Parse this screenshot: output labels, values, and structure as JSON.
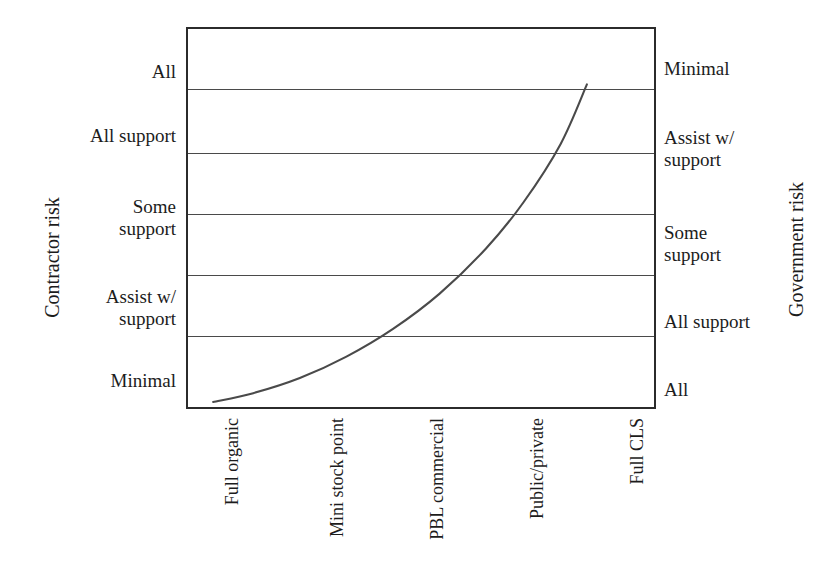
{
  "chart_data": {
    "type": "line",
    "title": "",
    "xlabel": "",
    "ylabel_left": "Contractor risk",
    "ylabel_right": "Government risk",
    "grid": true,
    "legend": "none",
    "categories": [
      "Full organic",
      "Mini stock point",
      "PBL commercial",
      "Public/private",
      "Full CLS"
    ],
    "y_left_ticks": [
      "Minimal",
      "Assist w/\nsupport",
      "Some\nsupport",
      "All support",
      "All"
    ],
    "y_right_ticks": [
      "All",
      "All support",
      "Some\nsupport",
      "Assist w/\nsupport",
      "Minimal"
    ],
    "ylim": [
      0,
      6
    ],
    "xlim": [
      0,
      5
    ],
    "series": [
      {
        "name": "Risk transfer curve",
        "color": "#4a4a4a",
        "x": [
          0.27,
          0.7,
          1.2,
          1.7,
          2.2,
          2.7,
          3.2,
          3.6,
          4.0,
          4.28
        ],
        "y": [
          0.08,
          0.22,
          0.46,
          0.8,
          1.24,
          1.8,
          2.52,
          3.25,
          4.18,
          5.12
        ]
      }
    ],
    "axis_ranges": {
      "y_min_label": "Minimal",
      "y_max_label": "All"
    }
  },
  "axes": {
    "left_title": "Contractor risk",
    "right_title": "Government risk"
  },
  "y_left": {
    "t0": "Minimal",
    "t1": "Assist w/\nsupport",
    "t2": "Some\nsupport",
    "t3": "All support",
    "t4": "All"
  },
  "y_right": {
    "t0": "All",
    "t1": "All support",
    "t2": "Some\nsupport",
    "t3": "Assist w/\nsupport",
    "t4": "Minimal"
  },
  "x_ticks": {
    "t0": "Full organic",
    "t1": "Mini stock point",
    "t2": "PBL commercial",
    "t3": "Public/private",
    "t4": "Full CLS"
  },
  "colors": {
    "frame": "#2b2b2b",
    "gridline": "#4a4a4a",
    "curve": "#4a4a4a",
    "text": "#1c1c1c",
    "background": "#ffffff"
  }
}
